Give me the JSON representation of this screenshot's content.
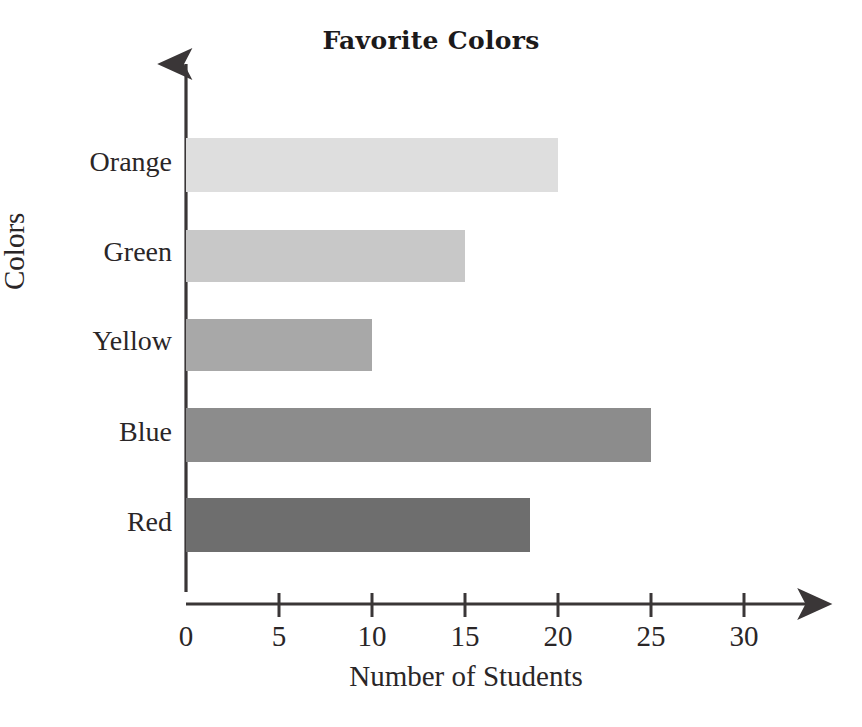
{
  "chart_data": {
    "type": "bar",
    "orientation": "horizontal",
    "title": "Favorite Colors",
    "xlabel": "Number of Students",
    "ylabel": "Colors",
    "categories": [
      "Red",
      "Blue",
      "Yellow",
      "Green",
      "Orange"
    ],
    "values": [
      18.5,
      25,
      10,
      15,
      20
    ],
    "xlim": [
      0,
      32
    ],
    "xticks": [
      0,
      5,
      10,
      15,
      20,
      25,
      30
    ],
    "xtick_labels": [
      "0",
      "5",
      "10",
      "15",
      "20",
      "25",
      "30"
    ],
    "grid": false,
    "legend": false,
    "bar_colors": [
      "#6e6e6e",
      "#8c8c8c",
      "#a8a8a8",
      "#c8c8c8",
      "#dedede"
    ],
    "axis_color": "#3a3637"
  },
  "figure": {
    "background": "#ffffff",
    "axis_arrows": true
  }
}
